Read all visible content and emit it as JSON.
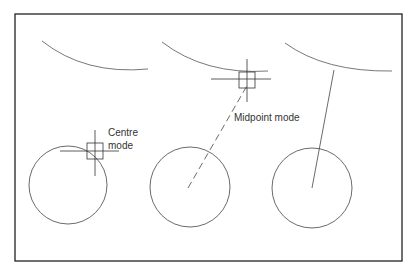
{
  "diagram": {
    "labels": {
      "centre_line1": "Centre",
      "centre_line2": "mode",
      "midpoint": "Midpoint mode"
    },
    "panels": [
      {
        "name": "centre-mode-example",
        "snap_mode": "Centre mode"
      },
      {
        "name": "midpoint-mode-example",
        "snap_mode": "Midpoint mode"
      },
      {
        "name": "result-example",
        "snap_mode": ""
      }
    ],
    "colors": {
      "stroke": "#444444",
      "frame": "#222222",
      "background": "#ffffff"
    }
  }
}
